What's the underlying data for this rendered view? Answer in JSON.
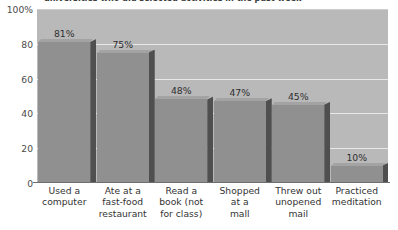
{
  "caption": "universities who did selected activities in the past week",
  "chart_data": {
    "type": "bar",
    "title": "",
    "subtitle": "",
    "xlabel": "",
    "ylabel": "",
    "categories": [
      "Used a\ncomputer",
      "Ate at a\nfast-food\nrestaurant",
      "Read a\nbook (not\nfor class)",
      "Shopped\nat a\nmall",
      "Threw out\nunopened\nmail",
      "Practiced\nmeditation"
    ],
    "values": [
      81,
      75,
      48,
      47,
      45,
      10
    ],
    "value_labels": [
      "81%",
      "75%",
      "48%",
      "47%",
      "45%",
      "10%"
    ],
    "ylim": [
      0,
      100
    ],
    "yticks": [
      0,
      20,
      40,
      60,
      80,
      100
    ],
    "ytick_labels": [
      "0",
      "20",
      "40",
      "60",
      "80",
      "100%"
    ],
    "grid": true,
    "grid_axis": "y",
    "legend": false,
    "style_3d": true,
    "colors": {
      "plot_background": "#b9b9b9",
      "bar_face": "#909090",
      "bar_side": "#4d4d4d",
      "bar_top": "#a3a3a3",
      "gridline": "#e8e8e8",
      "axis": "#6e6e6e",
      "text": "#333333"
    }
  }
}
